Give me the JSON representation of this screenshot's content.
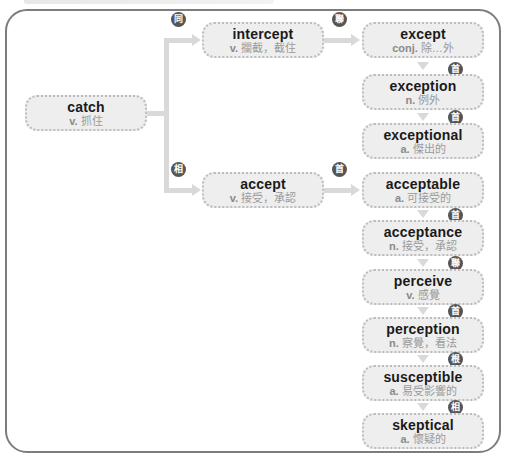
{
  "diagram": {
    "root": {
      "word": "catch",
      "pos": "v.",
      "meaning": "抓住"
    },
    "branches": [
      {
        "relation": "同",
        "word": "intercept",
        "pos": "v.",
        "meaning": "攔截，截住"
      },
      {
        "relation": "相",
        "word": "accept",
        "pos": "v.",
        "meaning": "接受，承認"
      }
    ],
    "chain_top": {
      "link_from_intercept": "聯",
      "nodes": [
        {
          "word": "except",
          "pos": "conj.",
          "meaning": "除…外"
        },
        {
          "relation": "首",
          "word": "exception",
          "pos": "n.",
          "meaning": "例外"
        },
        {
          "relation": "首",
          "word": "exceptional",
          "pos": "a.",
          "meaning": "傑出的"
        }
      ]
    },
    "chain_bottom": {
      "link_from_accept": "首",
      "nodes": [
        {
          "word": "acceptable",
          "pos": "a.",
          "meaning": "可接受的"
        },
        {
          "relation": "首",
          "word": "acceptance",
          "pos": "n.",
          "meaning": "接受，承認"
        },
        {
          "relation": "聯",
          "word": "perceive",
          "pos": "v.",
          "meaning": "感覺"
        },
        {
          "relation": "首",
          "word": "perception",
          "pos": "n.",
          "meaning": "察覺，看法"
        },
        {
          "relation": "根",
          "word": "susceptible",
          "pos": "a.",
          "meaning": "易受影響的"
        },
        {
          "relation": "相",
          "word": "skeptical",
          "pos": "a.",
          "meaning": "懷疑的"
        }
      ]
    },
    "colors": {
      "node_bg": "#eeeeee",
      "node_border": "#bdbdbd",
      "badge": "#555555",
      "connector": "#d9d9d9",
      "frame": "#7d7d7d"
    }
  }
}
